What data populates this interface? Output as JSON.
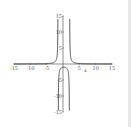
{
  "chart_data": {
    "type": "line",
    "title": "",
    "xlabel": "x",
    "ylabel": "",
    "xlim": [
      -15,
      15
    ],
    "ylim": [
      -15,
      15
    ],
    "x_ticks": [
      -15,
      -10,
      -5,
      5,
      10,
      15
    ],
    "y_ticks": [
      15,
      10,
      5,
      -5,
      -10,
      -15
    ],
    "x_tick_labels": [
      "-15",
      "-10",
      "-5",
      "5",
      "10",
      "15"
    ],
    "y_tick_labels": [
      "15",
      "10",
      "5",
      "-5",
      "-10",
      "-15"
    ],
    "grid": false,
    "legend": [],
    "asymptotes_x": [
      -1.5,
      2
    ],
    "series": [
      {
        "name": "f(x)",
        "formula": "3/((x+1.5)(x-2))",
        "color": "#333333"
      }
    ]
  }
}
